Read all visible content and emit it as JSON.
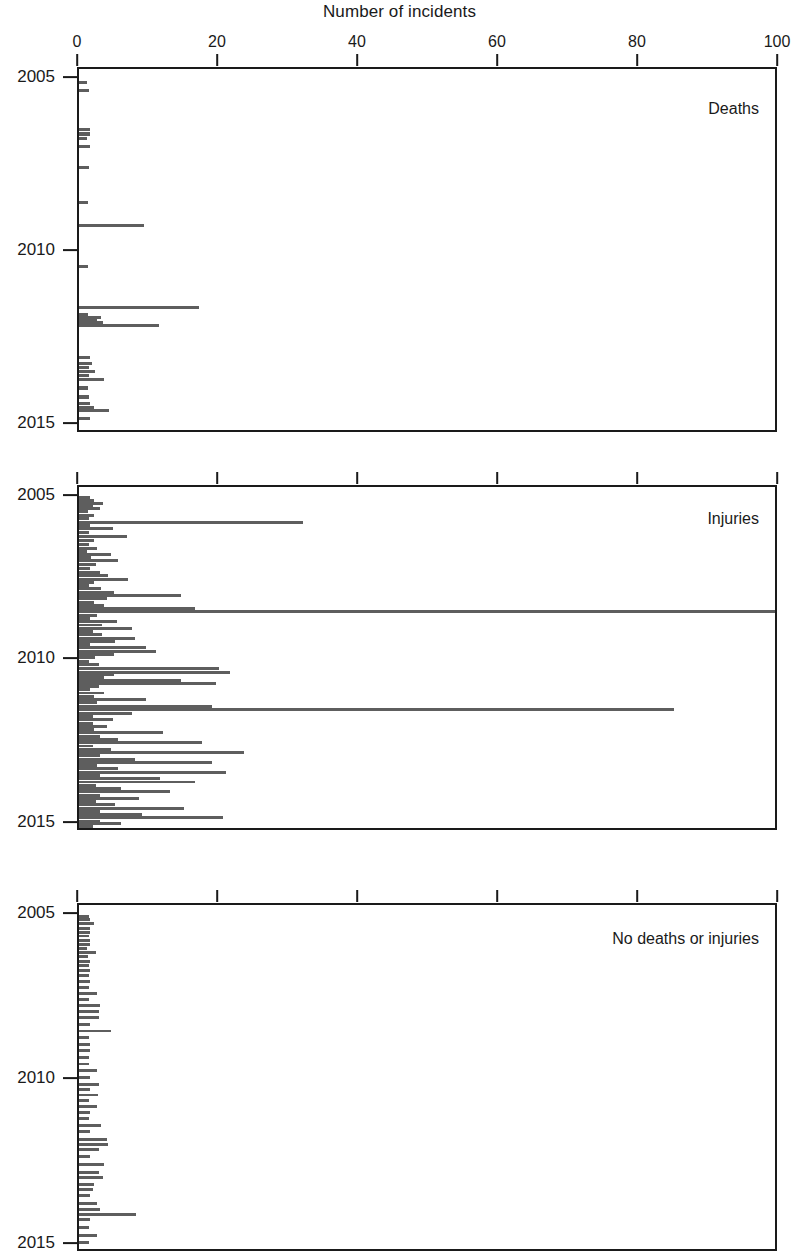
{
  "chart_data": {
    "type": "bar",
    "orientation": "horizontal",
    "title": "Number of incidents",
    "xlabel": "Number of incidents",
    "ylabel": "",
    "xlim": [
      0,
      100
    ],
    "ylim": [
      2004.7,
      2015.25
    ],
    "grid": false,
    "legend_position": "none",
    "x_ticks": [
      0,
      20,
      40,
      60,
      80,
      100
    ],
    "x_tick_labels": [
      "0",
      "20",
      "40",
      "60",
      "80",
      "100"
    ],
    "y_ticks": [
      2005,
      2010,
      2015
    ],
    "y_tick_labels": [
      "2005",
      "2010",
      "2015"
    ],
    "bar_color": "#5e5e5e",
    "axis_color": "#1a1a1a",
    "panels": [
      {
        "name": "deaths",
        "label": "Deaths",
        "series": [
          {
            "x": 2005.1,
            "value": 1.2
          },
          {
            "x": 2005.32,
            "value": 1.4
          },
          {
            "x": 2006.45,
            "value": 1.5
          },
          {
            "x": 2006.58,
            "value": 1.6
          },
          {
            "x": 2006.7,
            "value": 1.2
          },
          {
            "x": 2006.95,
            "value": 1.5
          },
          {
            "x": 2007.55,
            "value": 1.4
          },
          {
            "x": 2008.55,
            "value": 1.3
          },
          {
            "x": 2009.22,
            "value": 9.3
          },
          {
            "x": 2010.42,
            "value": 1.3
          },
          {
            "x": 2011.6,
            "value": 17.2
          },
          {
            "x": 2011.8,
            "value": 1.3
          },
          {
            "x": 2011.88,
            "value": 3.2
          },
          {
            "x": 2011.96,
            "value": 2.6
          },
          {
            "x": 2012.04,
            "value": 3.4
          },
          {
            "x": 2012.12,
            "value": 11.4
          },
          {
            "x": 2013.05,
            "value": 1.5
          },
          {
            "x": 2013.2,
            "value": 1.8
          },
          {
            "x": 2013.32,
            "value": 1.4
          },
          {
            "x": 2013.44,
            "value": 2.3
          },
          {
            "x": 2013.56,
            "value": 1.4
          },
          {
            "x": 2013.68,
            "value": 3.6
          },
          {
            "x": 2013.92,
            "value": 1.3
          },
          {
            "x": 2014.18,
            "value": 1.4
          },
          {
            "x": 2014.38,
            "value": 1.6
          },
          {
            "x": 2014.48,
            "value": 2.1
          },
          {
            "x": 2014.58,
            "value": 4.3
          },
          {
            "x": 2014.8,
            "value": 1.6
          }
        ]
      },
      {
        "name": "injuries",
        "label": "Injuries",
        "series": [
          {
            "x": 2005.03,
            "value": 1.6
          },
          {
            "x": 2005.12,
            "value": 2.2
          },
          {
            "x": 2005.2,
            "value": 3.4
          },
          {
            "x": 2005.28,
            "value": 2.0
          },
          {
            "x": 2005.36,
            "value": 3.0
          },
          {
            "x": 2005.44,
            "value": 1.3
          },
          {
            "x": 2005.56,
            "value": 2.1
          },
          {
            "x": 2005.66,
            "value": 1.4
          },
          {
            "x": 2005.78,
            "value": 32.0
          },
          {
            "x": 2005.88,
            "value": 1.6
          },
          {
            "x": 2005.98,
            "value": 4.8
          },
          {
            "x": 2006.1,
            "value": 1.4
          },
          {
            "x": 2006.22,
            "value": 6.9
          },
          {
            "x": 2006.34,
            "value": 2.1
          },
          {
            "x": 2006.46,
            "value": 1.4
          },
          {
            "x": 2006.58,
            "value": 2.6
          },
          {
            "x": 2006.66,
            "value": 1.2
          },
          {
            "x": 2006.76,
            "value": 4.5
          },
          {
            "x": 2006.86,
            "value": 1.7
          },
          {
            "x": 2006.96,
            "value": 5.6
          },
          {
            "x": 2007.08,
            "value": 2.4
          },
          {
            "x": 2007.2,
            "value": 1.5
          },
          {
            "x": 2007.32,
            "value": 3.0
          },
          {
            "x": 2007.42,
            "value": 4.2
          },
          {
            "x": 2007.52,
            "value": 7.0
          },
          {
            "x": 2007.62,
            "value": 2.2
          },
          {
            "x": 2007.7,
            "value": 1.4
          },
          {
            "x": 2007.8,
            "value": 3.1
          },
          {
            "x": 2007.92,
            "value": 5.0
          },
          {
            "x": 2008.02,
            "value": 14.6
          },
          {
            "x": 2008.12,
            "value": 4.0
          },
          {
            "x": 2008.22,
            "value": 2.2
          },
          {
            "x": 2008.32,
            "value": 3.6
          },
          {
            "x": 2008.42,
            "value": 16.5
          },
          {
            "x": 2008.52,
            "value": 100.0
          },
          {
            "x": 2008.62,
            "value": 2.6
          },
          {
            "x": 2008.72,
            "value": 1.6
          },
          {
            "x": 2008.82,
            "value": 5.4
          },
          {
            "x": 2008.92,
            "value": 3.3
          },
          {
            "x": 2009.02,
            "value": 7.6
          },
          {
            "x": 2009.12,
            "value": 2.0
          },
          {
            "x": 2009.22,
            "value": 3.3
          },
          {
            "x": 2009.32,
            "value": 8.0
          },
          {
            "x": 2009.42,
            "value": 5.1
          },
          {
            "x": 2009.52,
            "value": 1.5
          },
          {
            "x": 2009.62,
            "value": 9.6
          },
          {
            "x": 2009.72,
            "value": 11.0
          },
          {
            "x": 2009.82,
            "value": 5.0
          },
          {
            "x": 2009.92,
            "value": 2.3
          },
          {
            "x": 2010.05,
            "value": 1.4
          },
          {
            "x": 2010.14,
            "value": 2.8
          },
          {
            "x": 2010.26,
            "value": 20.0
          },
          {
            "x": 2010.36,
            "value": 21.5
          },
          {
            "x": 2010.44,
            "value": 5.0
          },
          {
            "x": 2010.52,
            "value": 3.6
          },
          {
            "x": 2010.62,
            "value": 14.5
          },
          {
            "x": 2010.7,
            "value": 19.5
          },
          {
            "x": 2010.8,
            "value": 2.8
          },
          {
            "x": 2010.9,
            "value": 1.5
          },
          {
            "x": 2011.0,
            "value": 3.6
          },
          {
            "x": 2011.1,
            "value": 2.1
          },
          {
            "x": 2011.2,
            "value": 9.5
          },
          {
            "x": 2011.3,
            "value": 2.6
          },
          {
            "x": 2011.4,
            "value": 19.0
          },
          {
            "x": 2011.5,
            "value": 85.0
          },
          {
            "x": 2011.62,
            "value": 7.5
          },
          {
            "x": 2011.72,
            "value": 2.0
          },
          {
            "x": 2011.82,
            "value": 4.8
          },
          {
            "x": 2011.92,
            "value": 2.0
          },
          {
            "x": 2012.02,
            "value": 4.0
          },
          {
            "x": 2012.12,
            "value": 2.1
          },
          {
            "x": 2012.22,
            "value": 12.0
          },
          {
            "x": 2012.32,
            "value": 3.0
          },
          {
            "x": 2012.42,
            "value": 5.6
          },
          {
            "x": 2012.52,
            "value": 17.6
          },
          {
            "x": 2012.62,
            "value": 2.0
          },
          {
            "x": 2012.72,
            "value": 4.5
          },
          {
            "x": 2012.82,
            "value": 23.5
          },
          {
            "x": 2012.92,
            "value": 3.0
          },
          {
            "x": 2013.02,
            "value": 8.0
          },
          {
            "x": 2013.12,
            "value": 19.0
          },
          {
            "x": 2013.22,
            "value": 2.6
          },
          {
            "x": 2013.32,
            "value": 5.5
          },
          {
            "x": 2013.42,
            "value": 21.0
          },
          {
            "x": 2013.52,
            "value": 3.0
          },
          {
            "x": 2013.62,
            "value": 11.5
          },
          {
            "x": 2013.72,
            "value": 16.5
          },
          {
            "x": 2013.82,
            "value": 2.4
          },
          {
            "x": 2013.92,
            "value": 6.0
          },
          {
            "x": 2014.02,
            "value": 13.0
          },
          {
            "x": 2014.12,
            "value": 3.0
          },
          {
            "x": 2014.22,
            "value": 8.6
          },
          {
            "x": 2014.32,
            "value": 2.4
          },
          {
            "x": 2014.42,
            "value": 5.2
          },
          {
            "x": 2014.52,
            "value": 15.0
          },
          {
            "x": 2014.62,
            "value": 3.0
          },
          {
            "x": 2014.72,
            "value": 9.0
          },
          {
            "x": 2014.82,
            "value": 20.5
          },
          {
            "x": 2014.92,
            "value": 3.0
          },
          {
            "x": 2015.0,
            "value": 6.0
          },
          {
            "x": 2015.08,
            "value": 2.0
          }
        ]
      },
      {
        "name": "no_deaths_or_injuries",
        "label": "No deaths or injuries",
        "series": [
          {
            "x": 2005.05,
            "value": 1.4
          },
          {
            "x": 2005.14,
            "value": 1.5
          },
          {
            "x": 2005.26,
            "value": 2.2
          },
          {
            "x": 2005.4,
            "value": 1.5
          },
          {
            "x": 2005.52,
            "value": 1.6
          },
          {
            "x": 2005.64,
            "value": 1.4
          },
          {
            "x": 2005.78,
            "value": 1.5
          },
          {
            "x": 2005.9,
            "value": 1.5
          },
          {
            "x": 2006.02,
            "value": 1.2
          },
          {
            "x": 2006.14,
            "value": 2.4
          },
          {
            "x": 2006.26,
            "value": 1.3
          },
          {
            "x": 2006.4,
            "value": 1.5
          },
          {
            "x": 2006.54,
            "value": 1.4
          },
          {
            "x": 2006.68,
            "value": 1.5
          },
          {
            "x": 2006.84,
            "value": 1.4
          },
          {
            "x": 2007.02,
            "value": 1.5
          },
          {
            "x": 2007.2,
            "value": 1.4
          },
          {
            "x": 2007.38,
            "value": 2.6
          },
          {
            "x": 2007.56,
            "value": 1.4
          },
          {
            "x": 2007.74,
            "value": 3.0
          },
          {
            "x": 2007.92,
            "value": 2.8
          },
          {
            "x": 2008.12,
            "value": 2.8
          },
          {
            "x": 2008.32,
            "value": 1.5
          },
          {
            "x": 2008.52,
            "value": 4.6
          },
          {
            "x": 2008.72,
            "value": 1.4
          },
          {
            "x": 2008.92,
            "value": 1.6
          },
          {
            "x": 2009.12,
            "value": 1.5
          },
          {
            "x": 2009.32,
            "value": 1.4
          },
          {
            "x": 2009.52,
            "value": 1.4
          },
          {
            "x": 2009.72,
            "value": 2.6
          },
          {
            "x": 2009.92,
            "value": 1.5
          },
          {
            "x": 2010.14,
            "value": 2.8
          },
          {
            "x": 2010.3,
            "value": 1.5
          },
          {
            "x": 2010.46,
            "value": 2.7
          },
          {
            "x": 2010.62,
            "value": 1.4
          },
          {
            "x": 2010.8,
            "value": 2.6
          },
          {
            "x": 2010.98,
            "value": 1.5
          },
          {
            "x": 2011.18,
            "value": 1.4
          },
          {
            "x": 2011.38,
            "value": 3.2
          },
          {
            "x": 2011.58,
            "value": 1.5
          },
          {
            "x": 2011.8,
            "value": 4.0
          },
          {
            "x": 2011.96,
            "value": 4.2
          },
          {
            "x": 2012.12,
            "value": 2.8
          },
          {
            "x": 2012.32,
            "value": 1.5
          },
          {
            "x": 2012.56,
            "value": 3.6
          },
          {
            "x": 2012.8,
            "value": 2.8
          },
          {
            "x": 2012.96,
            "value": 3.4
          },
          {
            "x": 2013.16,
            "value": 2.2
          },
          {
            "x": 2013.32,
            "value": 2.0
          },
          {
            "x": 2013.52,
            "value": 1.5
          },
          {
            "x": 2013.76,
            "value": 2.6
          },
          {
            "x": 2013.92,
            "value": 3.0
          },
          {
            "x": 2014.08,
            "value": 8.2
          },
          {
            "x": 2014.24,
            "value": 1.5
          },
          {
            "x": 2014.48,
            "value": 1.4
          },
          {
            "x": 2014.72,
            "value": 2.6
          },
          {
            "x": 2014.94,
            "value": 1.4
          }
        ]
      }
    ]
  }
}
